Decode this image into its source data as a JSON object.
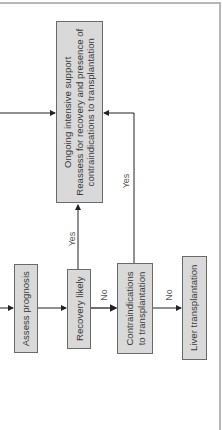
{
  "diagram": {
    "orientation": "rotated-90-ccw",
    "nodes": {
      "ongoing": {
        "lines": [
          "Ongoing intensive support",
          "Reassess for recovery and presence of",
          "contraindications to transplantation"
        ]
      },
      "assess": {
        "lines": [
          "Assess prognosis"
        ]
      },
      "recovery": {
        "lines": [
          "Recovery likely"
        ]
      },
      "contra": {
        "lines": [
          "Contraindications",
          "to transplantation"
        ]
      },
      "liver": {
        "lines": [
          "Liver transplantation"
        ]
      }
    },
    "edges": {
      "recovery_yes": "Yes",
      "recovery_no": "No",
      "contra_yes": "Yes",
      "contra_no": "No"
    },
    "colors": {
      "box_fill": "#d9d9d9",
      "box_border": "#6a6a6a",
      "line": "#222222",
      "text": "#3a3a3a"
    }
  }
}
